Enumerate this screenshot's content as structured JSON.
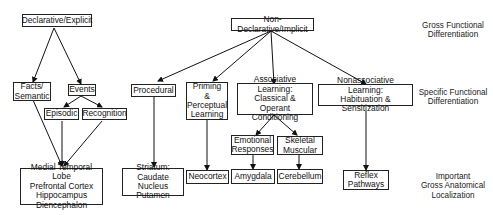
{
  "diagram": {
    "nodes": {
      "declarative": "Declarative/Explicit",
      "nondeclarative": "Non-Declarative/Implicit",
      "facts": "Facts/\nSemantic",
      "events": "Events",
      "episodic": "Episodic",
      "recognition": "Recognition",
      "procedural": "Procedural",
      "priming": "Priming\n&\nPerceptual\nLearning",
      "associative": "Associative Learning:\nClassical & Operant\nConditioning",
      "nonassociative": "Nonassociative Learning:\nHabituation & Sensitization",
      "emotional": "Emotional\nResponses",
      "skeletal": "Skeletal\nMuscular",
      "mtl": "Medial Temporal Lobe\nPrefrontal Cortex\nHippocampus\nDiencephalon",
      "striatum": "Striatum:\nCaudate Nucleus\nPutamen",
      "neocortex": "Neocortex",
      "amygdala": "Amygdala",
      "cerebellum": "Cerebellum",
      "reflex": "Reflex\nPathways"
    },
    "level_labels": {
      "gross_functional": "Gross Functional\nDifferentiation",
      "specific_functional": "Specific Functional\nDifferentiation",
      "anatomical": "Important\nGross Anatomical\nLocalization"
    },
    "edges": [
      [
        "declarative",
        "facts"
      ],
      [
        "declarative",
        "events"
      ],
      [
        "events",
        "episodic"
      ],
      [
        "events",
        "recognition"
      ],
      [
        "facts",
        "mtl"
      ],
      [
        "episodic",
        "mtl"
      ],
      [
        "recognition",
        "mtl"
      ],
      [
        "nondeclarative",
        "procedural"
      ],
      [
        "nondeclarative",
        "priming"
      ],
      [
        "nondeclarative",
        "associative"
      ],
      [
        "nondeclarative",
        "nonassociative"
      ],
      [
        "associative",
        "emotional"
      ],
      [
        "associative",
        "skeletal"
      ],
      [
        "procedural",
        "striatum"
      ],
      [
        "priming",
        "neocortex"
      ],
      [
        "emotional",
        "amygdala"
      ],
      [
        "skeletal",
        "cerebellum"
      ],
      [
        "nonassociative",
        "reflex"
      ]
    ]
  }
}
